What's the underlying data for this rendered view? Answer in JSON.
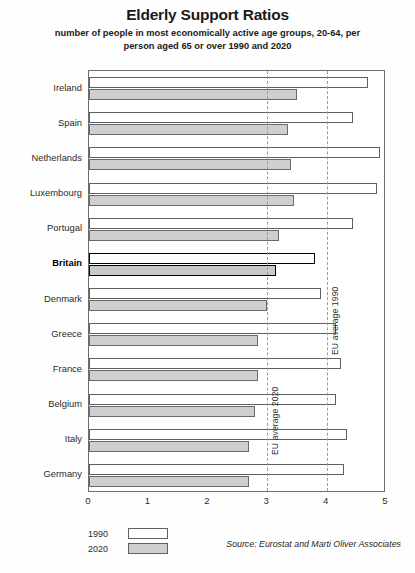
{
  "header": {
    "title": "Elderly Support Ratios",
    "subtitle": "number of people in most economically active age groups, 20-64, per person aged 65 or over 1990 and 2020"
  },
  "legend": {
    "items": [
      {
        "label": "1990",
        "swatch": "white"
      },
      {
        "label": "2020",
        "swatch": "grey"
      }
    ]
  },
  "source": "Source: Eurostat and Marti Oliver Associates",
  "chart_data": {
    "type": "bar",
    "orientation": "horizontal",
    "title": "Elderly Support Ratios",
    "subtitle": "number of people in most economically active age groups, 20-64, per person aged 65 or over 1990 and 2020",
    "xlabel": "",
    "ylabel": "",
    "xlim": [
      0,
      5
    ],
    "xticks": [
      "0",
      "1",
      "2",
      "3",
      "4",
      "5"
    ],
    "grid": false,
    "legend_position": "bottom-left",
    "highlight_category": "Britain",
    "categories": [
      "Ireland",
      "Spain",
      "Netherlands",
      "Luxembourg",
      "Portugal",
      "Britain",
      "Denmark",
      "Greece",
      "France",
      "Belgium",
      "Italy",
      "Germany"
    ],
    "series": [
      {
        "name": "1990",
        "color": "#ffffff",
        "values": [
          4.7,
          4.45,
          4.9,
          4.85,
          4.45,
          3.8,
          3.9,
          4.15,
          4.25,
          4.15,
          4.35,
          4.3
        ]
      },
      {
        "name": "2020",
        "color": "#cfcfcf",
        "values": [
          3.5,
          3.35,
          3.4,
          3.45,
          3.2,
          3.15,
          3.0,
          2.85,
          2.85,
          2.8,
          2.7,
          2.7
        ]
      }
    ],
    "reference_lines": [
      {
        "label": "EU average 2020",
        "value": 3.0,
        "style": "dashed"
      },
      {
        "label": "EU average 1990",
        "value": 4.0,
        "style": "dashed"
      }
    ]
  }
}
